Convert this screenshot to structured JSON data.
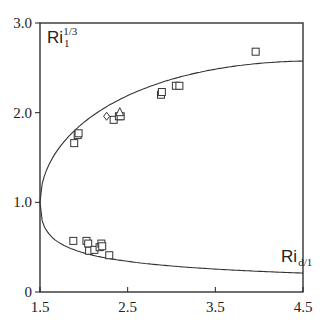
{
  "chart_data": {
    "type": "scatter",
    "title": "",
    "xlabel": "",
    "ylabel": "",
    "xlim": [
      1.5,
      4.5
    ],
    "ylim": [
      0,
      3.0
    ],
    "grid": false,
    "x_ticks": [
      "1.5",
      "2.5",
      "3.5",
      "4.5"
    ],
    "y_ticks": [
      "0",
      "1.0",
      "2.0",
      "3.0"
    ],
    "annotations": [
      {
        "text": "Ri",
        "sub": "1",
        "sup": "1/3",
        "x": 1.58,
        "y": 2.78
      },
      {
        "text": "Ri",
        "sub": "d/1",
        "x": 4.25,
        "y": 0.33
      }
    ],
    "curves": [
      {
        "name": "upper branch (Ri_1^1/3)",
        "x": [
          1.5,
          1.6,
          1.75,
          2.0,
          2.25,
          2.5,
          2.75,
          3.0,
          3.5,
          4.0,
          4.5
        ],
        "y": [
          1.0,
          1.25,
          1.45,
          1.68,
          1.86,
          2.02,
          2.16,
          2.29,
          2.52,
          2.71,
          2.88
        ]
      },
      {
        "name": "lower branch (Ri_d/1)",
        "x": [
          1.5,
          1.6,
          1.75,
          2.0,
          2.25,
          2.5,
          2.75,
          3.0,
          3.5,
          4.0,
          4.5
        ],
        "y": [
          1.0,
          0.8,
          0.69,
          0.6,
          0.53,
          0.47,
          0.43,
          0.39,
          0.33,
          0.28,
          0.24
        ]
      }
    ],
    "series": [
      {
        "name": "squares (upper)",
        "marker": "square",
        "x": [
          1.89,
          1.93,
          1.94,
          2.34,
          2.4,
          2.42,
          2.88,
          2.89,
          3.05,
          3.09,
          3.96
        ],
        "y": [
          1.66,
          1.75,
          1.77,
          1.92,
          1.96,
          1.96,
          2.2,
          2.23,
          2.3,
          2.3,
          2.68
        ]
      },
      {
        "name": "diamond",
        "marker": "diamond",
        "x": [
          2.26
        ],
        "y": [
          1.96
        ]
      },
      {
        "name": "triangle",
        "marker": "triangle",
        "x": [
          2.41
        ],
        "y": [
          2.0
        ]
      },
      {
        "name": "squares (lower)",
        "marker": "square",
        "x": [
          1.88,
          2.03,
          2.05,
          2.06,
          2.12,
          2.18,
          2.2,
          2.21,
          2.29
        ],
        "y": [
          0.57,
          0.57,
          0.54,
          0.46,
          0.47,
          0.5,
          0.54,
          0.51,
          0.41
        ]
      }
    ]
  }
}
